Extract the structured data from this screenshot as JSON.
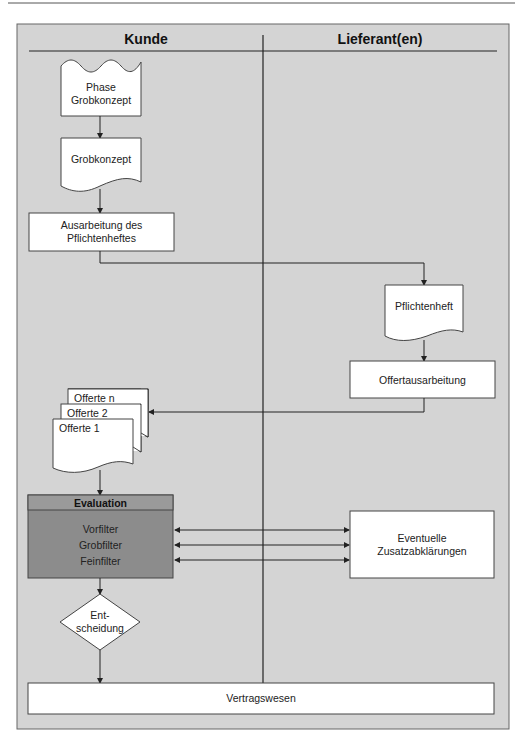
{
  "diagram": {
    "lanes": [
      {
        "id": "kunde",
        "title": "Kunde"
      },
      {
        "id": "lieferant",
        "title": "Lieferant(en)"
      }
    ],
    "nodes": {
      "phase_grobkonzept": {
        "shape": "document-wavy-top",
        "lane": "kunde",
        "line1": "Phase",
        "line2": "Grobkonzept"
      },
      "grobkonzept": {
        "shape": "document",
        "lane": "kunde",
        "label": "Grobkonzept"
      },
      "ausarbeitung": {
        "shape": "process",
        "lane": "kunde",
        "line1": "Ausarbeitung des",
        "line2": "Pflichtenheftes"
      },
      "pflichtenheft": {
        "shape": "document",
        "lane": "lieferant",
        "label": "Pflichtenheft"
      },
      "offertausarbeitung": {
        "shape": "process",
        "lane": "lieferant",
        "label": "Offertausarbeitung"
      },
      "offerten": {
        "shape": "multi-document",
        "lane": "kunde",
        "items": [
          "Offerte n",
          "Offerte 2",
          "Offerte 1"
        ]
      },
      "evaluation": {
        "shape": "process-shaded",
        "lane": "kunde",
        "title": "Evaluation",
        "items": [
          "Vorfilter",
          "Grobfilter",
          "Feinfilter"
        ]
      },
      "zusatzabklaerungen": {
        "shape": "process",
        "lane": "lieferant",
        "line1": "Eventuelle",
        "line2": "Zusatzabklärungen"
      },
      "entscheidung": {
        "shape": "decision",
        "lane": "kunde",
        "line1": "Ent-",
        "line2": "scheidung"
      },
      "vertragswesen": {
        "shape": "process",
        "lane": "both",
        "label": "Vertragswesen"
      }
    },
    "edges": [
      {
        "from": "phase_grobkonzept",
        "to": "grobkonzept"
      },
      {
        "from": "grobkonzept",
        "to": "ausarbeitung"
      },
      {
        "from": "ausarbeitung",
        "to": "pflichtenheft"
      },
      {
        "from": "pflichtenheft",
        "to": "offertausarbeitung"
      },
      {
        "from": "offertausarbeitung",
        "to": "offerten"
      },
      {
        "from": "offerten",
        "to": "evaluation"
      },
      {
        "from": "evaluation",
        "to": "zusatzabklaerungen",
        "bidirectional": true,
        "label": "Vorfilter"
      },
      {
        "from": "evaluation",
        "to": "zusatzabklaerungen",
        "bidirectional": true,
        "label": "Grobfilter"
      },
      {
        "from": "evaluation",
        "to": "zusatzabklaerungen",
        "bidirectional": true,
        "label": "Feinfilter"
      },
      {
        "from": "evaluation",
        "to": "entscheidung"
      },
      {
        "from": "entscheidung",
        "to": "vertragswesen"
      }
    ],
    "colors": {
      "page_background": "#ffffff",
      "frame_background": "#d4d4d4",
      "node_fill": "#ffffff",
      "evaluation_fill": "#8c8c8c",
      "evaluation_header_fill": "#9a9a9a",
      "line": "#2a2a2a"
    }
  }
}
